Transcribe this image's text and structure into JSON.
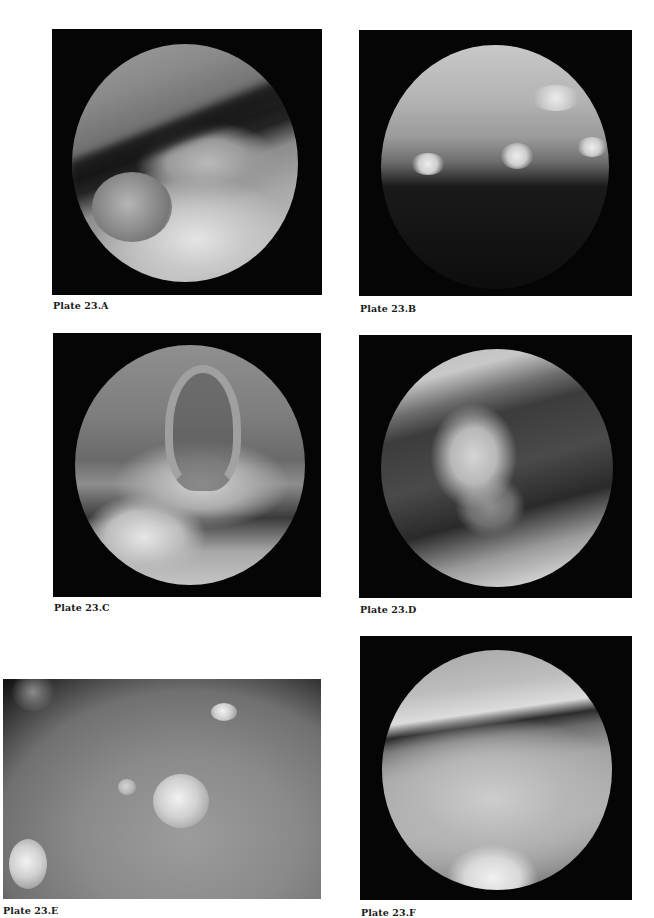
{
  "page": {
    "type": "atlas-plate-page",
    "background": "#ffffff"
  },
  "plates": [
    {
      "id": "A",
      "caption": "Plate 23.A",
      "image_kind": "circular endoscopic view",
      "tone": "grayscale"
    },
    {
      "id": "B",
      "caption": "Plate 23.B",
      "image_kind": "circular endoscopic view",
      "tone": "grayscale"
    },
    {
      "id": "C",
      "caption": "Plate 23.C",
      "image_kind": "circular endoscopic view",
      "tone": "grayscale"
    },
    {
      "id": "D",
      "caption": "Plate 23.D",
      "image_kind": "circular endoscopic view",
      "tone": "grayscale"
    },
    {
      "id": "E",
      "caption": "Plate 23.E",
      "image_kind": "close-up endoscopic view",
      "tone": "grayscale"
    },
    {
      "id": "F",
      "caption": "Plate 23.F",
      "image_kind": "circular endoscopic view",
      "tone": "grayscale"
    }
  ],
  "colors": {
    "frame": "#050505",
    "caption_text": "#1a1a1a"
  }
}
